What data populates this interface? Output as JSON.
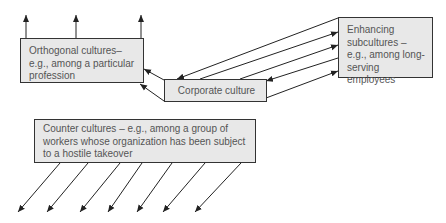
{
  "diagram": {
    "nodes": {
      "orthogonal": "Orthogonal cultures– e.g., among a particular profession",
      "corporate": "Corporate culture",
      "enhancing": "Enhancing subcultures – e.g., among long-serving employees",
      "counter": "Counter cultures – e.g., among a group of workers whose organization has been subject to a hostile takeover"
    },
    "colors": {
      "box_fill": "#e8e8e8",
      "box_border": "#333333",
      "text": "#555555",
      "arrow": "#222222"
    },
    "edges": [
      {
        "from": "corporate",
        "to": "orthogonal",
        "count": 2
      },
      {
        "from": "enhancing",
        "to": "corporate",
        "count": 2
      },
      {
        "from": "corporate",
        "to": "enhancing",
        "count": 3
      },
      {
        "from": "orthogonal",
        "to": "outward-up",
        "count": 3
      },
      {
        "from": "counter",
        "to": "outward-down-left",
        "count": 7
      }
    ]
  }
}
